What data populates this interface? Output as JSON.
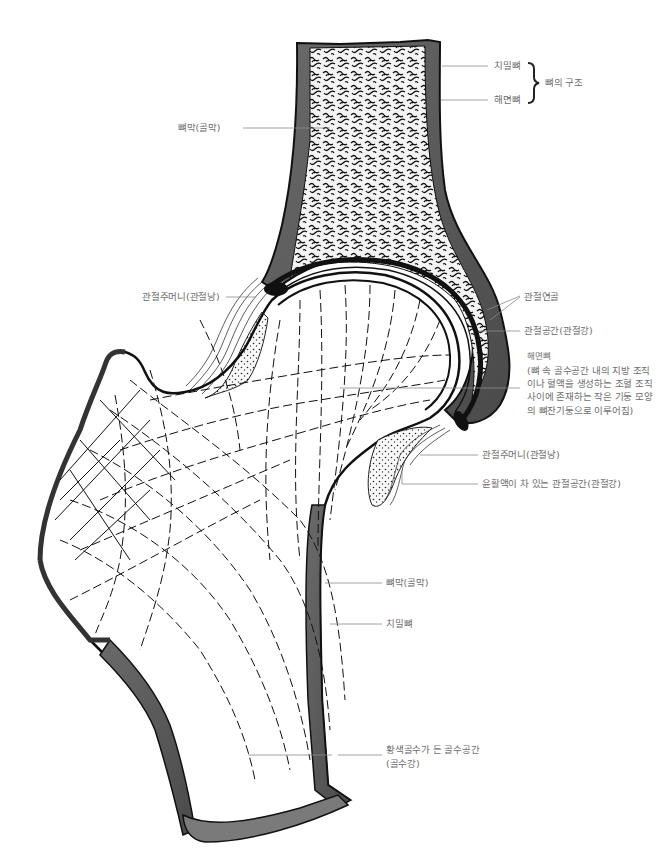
{
  "diagram": {
    "colors": {
      "ink": "#1a1a1a",
      "cortex": "#5a5a5a",
      "label": "#6e6e6e",
      "leader": "#8a8a8a",
      "background": "#ffffff"
    },
    "labels": {
      "compact_bone_top": "치밀뼈",
      "spongy_bone_top": "해면뼈",
      "bone_structure": "뼈의 구조",
      "periosteum_top": "뼈막(골막)",
      "joint_capsule_left": "관절주머니(관절낭)",
      "articular_cartilage": "관절연골",
      "joint_cavity": "관절공간(관절강)",
      "spongy_bone_detail_title": "해면뼈",
      "spongy_bone_detail_desc": "(뼈 속 골수공간 내의 지방 조직이나 혈액을 생성하는 조혈 조직 사이에 존재하는 작은 기둥 모양의 뼈잔기둥으로 이루어짐)",
      "joint_capsule_right": "관절주머니(관절낭)",
      "synovial_cavity": "윤활액이 차 있는 관절공간(관절강)",
      "periosteum_bottom": "뼈막(골막)",
      "compact_bone_bottom": "치밀뼈",
      "marrow_cavity": "황색골수가 든 골수공간",
      "marrow_cavity_sub": "(골수강)"
    }
  }
}
